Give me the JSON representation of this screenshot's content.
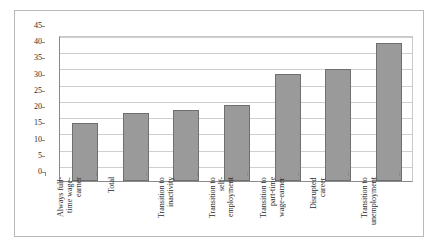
{
  "chart_data": {
    "type": "bar",
    "title": "",
    "xlabel": "",
    "ylabel": "",
    "ylim": [
      0,
      45
    ],
    "ytick_labels": [
      "45",
      "40",
      "35",
      "30",
      "25",
      "20",
      "15",
      "10",
      "5",
      "0"
    ],
    "ytick_values": [
      45,
      40,
      35,
      30,
      25,
      20,
      15,
      10,
      5,
      0
    ],
    "grid": true,
    "legend": "none",
    "bar_color": "#9a9a9a",
    "bar_border_color": "#6f6f6f",
    "categories": [
      "Always full-\ntime wage-\nearner",
      "Total",
      "Transition to\ninactivity",
      "Transition to\nself-\nemployment",
      "Transition to\npart-time\nwage-earner",
      "Disrupted\ncareer",
      "Transition to\nunemployment"
    ],
    "values": [
      18,
      21,
      22,
      23.5,
      33,
      34.5,
      42.5
    ]
  }
}
